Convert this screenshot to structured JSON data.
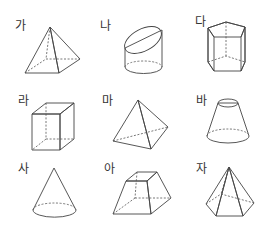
{
  "figure": {
    "shapes": [
      {
        "label": "가",
        "shape": "square-pyramid"
      },
      {
        "label": "나",
        "shape": "truncated-cylinder"
      },
      {
        "label": "다",
        "shape": "pentagonal-prism"
      },
      {
        "label": "라",
        "shape": "cube"
      },
      {
        "label": "마",
        "shape": "triangular-pyramid"
      },
      {
        "label": "바",
        "shape": "frustum-of-cone"
      },
      {
        "label": "사",
        "shape": "cone"
      },
      {
        "label": "아",
        "shape": "square-frustum"
      },
      {
        "label": "자",
        "shape": "pentagonal-pyramid"
      }
    ]
  },
  "colors": {
    "face_light": "#d9d9d9",
    "face_mid": "#b5b5b5",
    "face_dark": "#8f8f8f",
    "edge": "#444444"
  }
}
